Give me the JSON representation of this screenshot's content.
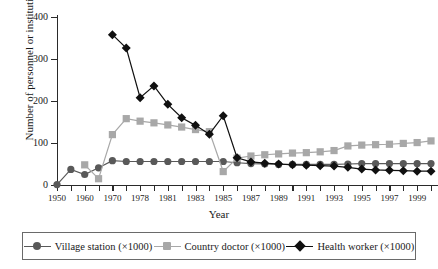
{
  "chart_data": {
    "type": "line",
    "title": "",
    "xlabel": "Year",
    "ylabel": "Number of personnel or institutions",
    "ylim": [
      0,
      400
    ],
    "yticks": [
      0,
      100,
      200,
      300,
      400
    ],
    "grid": false,
    "legend_position": "bottom",
    "x": [
      "1950",
      "1955",
      "1960",
      "1965",
      "1970",
      "1975",
      "1978",
      "1980",
      "1981",
      "1982",
      "1983",
      "1984",
      "1985",
      "1986",
      "1987",
      "1988",
      "1989",
      "1990",
      "1991",
      "1992",
      "1993",
      "1994",
      "1995",
      "1996",
      "1997",
      "1998",
      "1999",
      "2000"
    ],
    "xtick_labels": [
      "1950",
      "",
      "1960",
      "",
      "1970",
      "",
      "1978",
      "",
      "1981",
      "",
      "1983",
      "",
      "1985",
      "",
      "1987",
      "",
      "1989",
      "",
      "1991",
      "",
      "1993",
      "",
      "1995",
      "",
      "1997",
      "",
      "1999",
      ""
    ],
    "series": [
      {
        "name": "Village station (×1000)",
        "color": "#595959",
        "marker": "circle",
        "values": [
          1,
          37,
          25,
          41,
          58,
          56,
          56,
          56,
          56,
          56,
          56,
          56,
          56,
          53,
          51,
          50,
          49,
          49,
          49,
          49,
          49,
          50,
          51,
          51,
          51,
          51,
          51,
          51
        ]
      },
      {
        "name": "Country doctor (×1000)",
        "color": "#a8a8a8",
        "marker": "square",
        "values": [
          null,
          null,
          48,
          15,
          120,
          158,
          152,
          148,
          143,
          138,
          132,
          127,
          32,
          64,
          69,
          72,
          74,
          76,
          77,
          79,
          82,
          93,
          95,
          96,
          97,
          99,
          101,
          105
        ]
      },
      {
        "name": "Health worker (×1000)",
        "color": "#101010",
        "marker": "diamond",
        "values": [
          null,
          null,
          null,
          null,
          358,
          326,
          208,
          236,
          192,
          160,
          142,
          121,
          165,
          65,
          55,
          52,
          50,
          48,
          47,
          46,
          45,
          42,
          38,
          36,
          35,
          34,
          33,
          33
        ]
      }
    ]
  },
  "legend": {
    "items": [
      {
        "label": "Village station (×1000)"
      },
      {
        "label": "Country doctor (×1000)"
      },
      {
        "label": "Health worker (×1000)"
      }
    ]
  }
}
